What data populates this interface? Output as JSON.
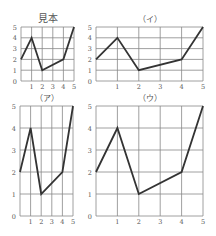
{
  "chart_data": [
    {
      "type": "line",
      "title": "見本",
      "x": [
        0,
        1,
        2,
        4,
        5
      ],
      "values": [
        2,
        4,
        1,
        2,
        5
      ],
      "x_ticks": [
        "1",
        "2",
        "3",
        "4",
        "5"
      ],
      "y_ticks": [
        "0",
        "1",
        "2",
        "3",
        "4",
        "5"
      ],
      "xlim": [
        0,
        5
      ],
      "ylim": [
        0,
        5
      ],
      "grid": true,
      "box": {
        "left": 21,
        "top": 27,
        "right": 74,
        "bottom": 81
      }
    },
    {
      "type": "line",
      "title": "（イ）",
      "x": [
        0,
        1,
        2,
        4,
        5
      ],
      "values": [
        2,
        4,
        1,
        2,
        5
      ],
      "x_ticks": [
        "1",
        "2",
        "3",
        "4",
        "5"
      ],
      "y_ticks": [
        "0",
        "1",
        "2",
        "3",
        "4",
        "5"
      ],
      "xlim": [
        0,
        5
      ],
      "ylim": [
        0,
        5
      ],
      "grid": true,
      "box": {
        "left": 96,
        "top": 27,
        "right": 203,
        "bottom": 81
      }
    },
    {
      "type": "line",
      "title": "（ア）",
      "x": [
        0,
        1,
        2,
        4,
        5
      ],
      "values": [
        2,
        4,
        1,
        2,
        5
      ],
      "x_ticks": [
        "1",
        "2",
        "3",
        "4",
        "5"
      ],
      "y_ticks": [
        "0",
        "1",
        "2",
        "3",
        "4",
        "5"
      ],
      "xlim": [
        0,
        5
      ],
      "ylim": [
        0,
        5
      ],
      "grid": true,
      "box": {
        "left": 20,
        "top": 106,
        "right": 73,
        "bottom": 216
      }
    },
    {
      "type": "line",
      "title": "（ウ）",
      "x": [
        0,
        1,
        2,
        4,
        5
      ],
      "values": [
        2,
        4,
        1,
        2,
        5
      ],
      "x_ticks": [
        "1",
        "2",
        "3",
        "4",
        "5"
      ],
      "y_ticks": [
        "0",
        "1",
        "2",
        "3",
        "4",
        "5"
      ],
      "xlim": [
        0,
        5
      ],
      "ylim": [
        0,
        5
      ],
      "grid": true,
      "box": {
        "left": 96,
        "top": 106,
        "right": 203,
        "bottom": 216
      }
    }
  ],
  "colors": {
    "grid": "#888888",
    "line": "#333333",
    "label": "#555555"
  }
}
